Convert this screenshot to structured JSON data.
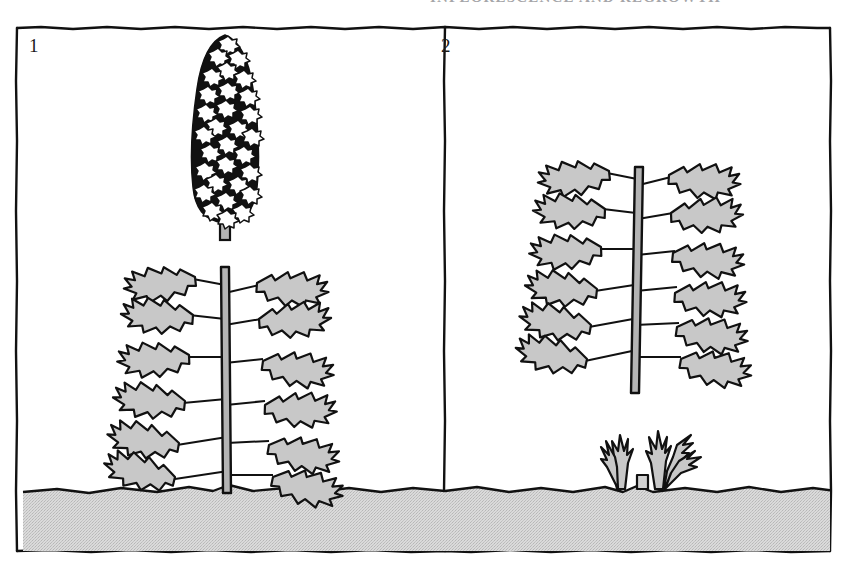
{
  "figure": {
    "caption_top_cut": "INFLORESCENCE AND REGROWTH",
    "caption_left_cut": "",
    "panels": [
      {
        "number": "1",
        "name": "intact-plant-panel",
        "description": "Uncut plant: flowering spike held above a leafy stem rooted in the soil",
        "elements": [
          {
            "name": "flower-spike",
            "label": "flowering spike"
          },
          {
            "name": "leafy-stem",
            "label": "leafy stem"
          },
          {
            "name": "soil-band",
            "label": "soil"
          }
        ]
      },
      {
        "number": "2",
        "name": "cut-plant-panel",
        "description": "Cut plant: severed leafy stem removed, leaving basal stubble and regrowth in the soil",
        "elements": [
          {
            "name": "severed-stem",
            "label": "severed leafy stem"
          },
          {
            "name": "stubble-regrowth",
            "label": "basal stubble"
          },
          {
            "name": "cut-stump",
            "label": "cut stump"
          },
          {
            "name": "soil-band",
            "label": "soil"
          }
        ]
      }
    ]
  },
  "colors": {
    "ink": "#111111",
    "leaf_fill": "#c8c8c8",
    "soil_fill": "#d2d2d2",
    "stem_fill": "#b4b4b4",
    "paper": "#ffffff"
  }
}
